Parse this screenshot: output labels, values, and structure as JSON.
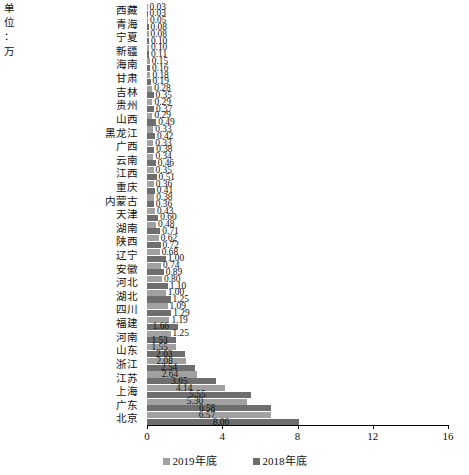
{
  "unit_note": [
    "单",
    "位",
    "：",
    "万"
  ],
  "chart_data": {
    "type": "bar",
    "orientation": "horizontal",
    "title": "",
    "xlabel": "",
    "ylabel": "",
    "xlim": [
      0,
      16
    ],
    "xticks": [
      0,
      4,
      8,
      12,
      16
    ],
    "xticklabels": [
      "0",
      "4",
      "8",
      "12",
      "16"
    ],
    "grid": false,
    "legend_position": "bottom",
    "categories": [
      "西藏",
      "青海",
      "宁夏",
      "新疆",
      "海南",
      "甘肃",
      "吉林",
      "贵州",
      "山西",
      "黑龙江",
      "广西",
      "云南",
      "江西",
      "重庆",
      "内蒙古",
      "天津",
      "湖南",
      "陕西",
      "辽宁",
      "安徽",
      "河北",
      "湖北",
      "四川",
      "福建",
      "河南",
      "山东",
      "浙江",
      "江苏",
      "上海",
      "广东",
      "北京"
    ],
    "series": [
      {
        "name": "2019年底",
        "color": "#a0a0a0",
        "values": [
          0.03,
          0.05,
          0.08,
          0.1,
          0.15,
          0.18,
          0.28,
          0.29,
          0.29,
          0.33,
          0.33,
          0.34,
          0.35,
          0.36,
          0.38,
          0.43,
          0.48,
          0.62,
          0.68,
          0.74,
          0.8,
          1.0,
          1.09,
          1.19,
          1.25,
          1.55,
          2.08,
          2.64,
          4.14,
          5.3,
          6.57
        ],
        "labels": [
          "0.03",
          "0.05",
          "0.08",
          "0.10",
          "0.15",
          "0.18",
          "0.28",
          "0.29",
          "0.29",
          "0.33",
          "0.33",
          "0.34",
          "0.35",
          "0.36",
          "0.38",
          "0.43",
          "0.48",
          "0.62",
          "0.68",
          "0.74",
          "0.80",
          "1.00",
          "1.09",
          "1.19",
          "1.25",
          "1.55",
          "2.08",
          "2.64",
          "4.14",
          "5.30",
          "6.57"
        ]
      },
      {
        "name": "2018年底",
        "color": "#6e6e6e",
        "values": [
          0.03,
          0.08,
          0.1,
          0.11,
          0.16,
          0.19,
          0.35,
          0.37,
          0.49,
          0.42,
          0.38,
          0.46,
          0.51,
          0.41,
          0.36,
          0.6,
          0.71,
          0.72,
          1.0,
          0.89,
          1.1,
          1.25,
          1.29,
          1.66,
          1.53,
          2.03,
          2.54,
          3.65,
          5.55,
          6.58,
          8.06
        ],
        "labels": [
          "0.03",
          "0.08",
          "0.10",
          "0.11",
          "0.16",
          "0.19",
          "0.35",
          "0.37",
          "0.49",
          "0.42",
          "0.38",
          "0.46",
          "0.51",
          "0.41",
          "0.36",
          "0.60",
          "0.71",
          "0.72",
          "1.00",
          "0.89",
          "1.10",
          "1.25",
          "1.29",
          "1.66",
          "1.53",
          "2.03",
          "2.54",
          "3.65",
          "5.55",
          "6.58",
          "8.06"
        ]
      }
    ]
  },
  "legend": [
    {
      "label": "2019年底"
    },
    {
      "label": "2018年底"
    }
  ]
}
